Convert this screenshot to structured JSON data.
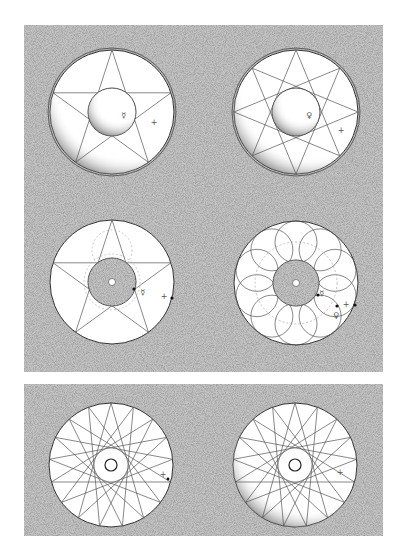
{
  "figure": {
    "background": "#ffffff",
    "panel_texture_color": "#a8a8a8",
    "stroke_color": "#555555",
    "panels": [
      {
        "id": "top-panel",
        "x": 24,
        "y": 25,
        "w": 359,
        "h": 347
      },
      {
        "id": "bottom-panel",
        "x": 24,
        "y": 384,
        "w": 359,
        "h": 152
      }
    ],
    "diagrams": [
      {
        "id": "shaded-sphere-pentagram",
        "cx": 112,
        "cy": 112,
        "r": 62,
        "inner_r": 24,
        "star_points": 5,
        "star_step": 2,
        "shaded": true,
        "symbols": [
          {
            "glyph": "☿",
            "x": 124,
            "y": 118
          },
          {
            "glyph": "+",
            "x": 154,
            "y": 125
          }
        ]
      },
      {
        "id": "shaded-sphere-octagram",
        "cx": 296,
        "cy": 112,
        "r": 62,
        "inner_r": 24,
        "star_points": 8,
        "star_step": 3,
        "shaded": true,
        "symbols": [
          {
            "glyph": "♀",
            "x": 309,
            "y": 118
          },
          {
            "glyph": "+",
            "x": 341,
            "y": 133
          }
        ]
      },
      {
        "id": "flat-pentagram-orbit",
        "cx": 112,
        "cy": 282,
        "r": 62,
        "inner_r": 24,
        "star_points": 5,
        "star_step": 2,
        "shaded": false,
        "symbols": [
          {
            "glyph": "☿",
            "x": 143,
            "y": 295
          },
          {
            "glyph": "+",
            "x": 164,
            "y": 299
          }
        ]
      },
      {
        "id": "ring-of-circles",
        "cx": 296,
        "cy": 283,
        "r": 62,
        "inner_r": 23,
        "ring_circles": 10,
        "ring_circle_r": 21,
        "shaded": false,
        "symbols": [
          {
            "glyph": "☿",
            "x": 322,
            "y": 296
          },
          {
            "glyph": "♀",
            "x": 336,
            "y": 318
          },
          {
            "glyph": "+",
            "x": 346,
            "y": 307
          }
        ]
      },
      {
        "id": "flat-seventeen-star",
        "cx": 111,
        "cy": 465,
        "r": 62,
        "inner_r": 6,
        "star_points": 17,
        "star_step": 7,
        "shaded": false,
        "symbols": [
          {
            "glyph": "+",
            "x": 163,
            "y": 477
          }
        ]
      },
      {
        "id": "shaded-seventeen-star",
        "cx": 295,
        "cy": 465,
        "r": 62,
        "inner_r": 6,
        "star_points": 17,
        "star_step": 7,
        "shaded": true,
        "symbols": [
          {
            "glyph": "+",
            "x": 340,
            "y": 475
          }
        ]
      }
    ]
  }
}
